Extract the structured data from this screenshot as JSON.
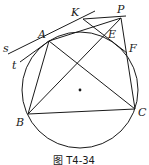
{
  "figure": {
    "caption": "图 T4-34",
    "circle": {
      "cx": 80,
      "cy": 90,
      "r": 58
    },
    "points": {
      "A": {
        "label": "A",
        "x": 49,
        "y": 41,
        "lx": 38,
        "ly": 38
      },
      "B": {
        "label": "B",
        "x": 28,
        "y": 114,
        "lx": 16,
        "ly": 126
      },
      "C": {
        "label": "C",
        "x": 135,
        "y": 109,
        "lx": 139,
        "ly": 115
      },
      "P": {
        "label": "P",
        "x": 121,
        "y": 18,
        "lx": 117,
        "ly": 13
      },
      "K": {
        "label": "K",
        "x": 83,
        "y": 19,
        "lx": 71,
        "ly": 16
      },
      "E": {
        "label": "E",
        "x": 105,
        "y": 35,
        "lx": 108,
        "ly": 37
      },
      "F": {
        "label": "F",
        "x": 127,
        "y": 53,
        "lx": 129,
        "ly": 52
      },
      "s": {
        "label": "s",
        "lx": 3,
        "ly": 51
      },
      "t": {
        "label": "t",
        "lx": 12,
        "ly": 68
      }
    },
    "center_dot": {
      "x": 80,
      "y": 90
    }
  }
}
